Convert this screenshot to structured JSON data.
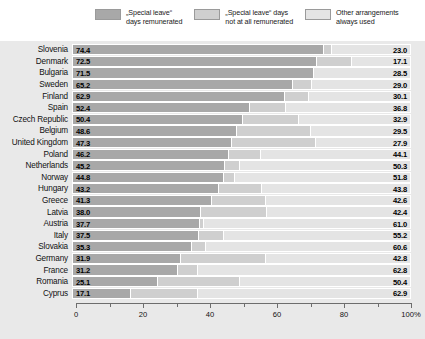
{
  "legend": {
    "items": [
      {
        "label": "„Special leave“\ndays remunerated",
        "color": "#a8a8a8",
        "key": "remunerated"
      },
      {
        "label": "„Special leave“ days\nnot at all remunerated",
        "color": "#cfcfcf",
        "key": "not-remunerated"
      },
      {
        "label": "Other arrangements\nalways used",
        "color": "#e4e4e4",
        "key": "other-arrangements"
      }
    ]
  },
  "axis": {
    "ticks": [
      "0",
      "20",
      "40",
      "60",
      "80",
      "100%"
    ],
    "tick_values": [
      0,
      20,
      40,
      60,
      80,
      100
    ],
    "minor_values": [
      10,
      30,
      50,
      70,
      90
    ]
  },
  "chart_data": {
    "type": "bar",
    "orientation": "horizontal",
    "stacked": true,
    "normalized": "100%",
    "title": "",
    "xlabel": "",
    "ylabel": "",
    "xlim": [
      0,
      100
    ],
    "grid": false,
    "legend_position": "top",
    "categories": [
      "Slovenia",
      "Denmark",
      "Bulgaria",
      "Sweden",
      "Finland",
      "Spain",
      "Czech Republic",
      "Belgium",
      "United Kingdom",
      "Poland",
      "Netherlands",
      "Norway",
      "Hungary",
      "Greece",
      "Latvia",
      "Austria",
      "Italy",
      "Slovakia",
      "Germany",
      "France",
      "Romania",
      "Cyprus"
    ],
    "series": [
      {
        "name": "„Special leave“ days remunerated",
        "color": "#a8a8a8",
        "values": [
          74.4,
          72.5,
          71.5,
          65.2,
          62.9,
          52.4,
          50.4,
          48.6,
          47.3,
          46.2,
          45.2,
          44.8,
          43.2,
          41.3,
          38.0,
          37.7,
          37.5,
          35.3,
          31.9,
          31.2,
          25.1,
          17.1
        ]
      },
      {
        "name": "„Special leave“ days not at all remunerated",
        "color": "#cfcfcf",
        "values": [
          2.6,
          10.4,
          0.0,
          5.8,
          7.0,
          10.8,
          16.7,
          21.9,
          24.8,
          9.7,
          4.5,
          3.4,
          13.0,
          16.1,
          19.6,
          1.3,
          7.3,
          4.1,
          25.3,
          6.0,
          24.5,
          20.0
        ]
      },
      {
        "name": "Other arrangements always used",
        "color": "#e4e4e4",
        "values": [
          23.0,
          17.1,
          28.5,
          29.0,
          30.1,
          36.8,
          32.9,
          29.5,
          27.9,
          44.1,
          50.3,
          51.8,
          43.8,
          42.6,
          42.4,
          61.0,
          55.2,
          60.6,
          42.8,
          62.8,
          50.4,
          62.9
        ]
      }
    ],
    "rows": [
      {
        "country": "Slovenia",
        "left": "74.4",
        "right": "23.0",
        "a": 74.4,
        "b": 2.6,
        "c": 23.0
      },
      {
        "country": "Denmark",
        "left": "72.5",
        "right": "17.1",
        "a": 72.5,
        "b": 10.4,
        "c": 17.1
      },
      {
        "country": "Bulgaria",
        "left": "71.5",
        "right": "28.5",
        "a": 71.5,
        "b": 0.0,
        "c": 28.5
      },
      {
        "country": "Sweden",
        "left": "65.2",
        "right": "29.0",
        "a": 65.2,
        "b": 5.8,
        "c": 29.0
      },
      {
        "country": "Finland",
        "left": "62.9",
        "right": "30.1",
        "a": 62.9,
        "b": 7.0,
        "c": 30.1
      },
      {
        "country": "Spain",
        "left": "52.4",
        "right": "36.8",
        "a": 52.4,
        "b": 10.8,
        "c": 36.8
      },
      {
        "country": "Czech Republic",
        "left": "50.4",
        "right": "32.9",
        "a": 50.4,
        "b": 16.7,
        "c": 32.9
      },
      {
        "country": "Belgium",
        "left": "48.6",
        "right": "29.5",
        "a": 48.6,
        "b": 21.9,
        "c": 29.5
      },
      {
        "country": "United Kingdom",
        "left": "47.3",
        "right": "27.9",
        "a": 47.3,
        "b": 24.8,
        "c": 27.9
      },
      {
        "country": "Poland",
        "left": "46.2",
        "right": "44.1",
        "a": 46.2,
        "b": 9.7,
        "c": 44.1
      },
      {
        "country": "Netherlands",
        "left": "45.2",
        "right": "50.3",
        "a": 45.2,
        "b": 4.5,
        "c": 50.3
      },
      {
        "country": "Norway",
        "left": "44.8",
        "right": "51.8",
        "a": 44.8,
        "b": 3.4,
        "c": 51.8
      },
      {
        "country": "Hungary",
        "left": "43.2",
        "right": "43.8",
        "a": 43.2,
        "b": 13.0,
        "c": 43.8
      },
      {
        "country": "Greece",
        "left": "41.3",
        "right": "42.6",
        "a": 41.3,
        "b": 16.1,
        "c": 42.6
      },
      {
        "country": "Latvia",
        "left": "38.0",
        "right": "42.4",
        "a": 38.0,
        "b": 19.6,
        "c": 42.4
      },
      {
        "country": "Austria",
        "left": "37.7",
        "right": "61.0",
        "a": 37.7,
        "b": 1.3,
        "c": 61.0
      },
      {
        "country": "Italy",
        "left": "37.5",
        "right": "55.2",
        "a": 37.5,
        "b": 7.3,
        "c": 55.2
      },
      {
        "country": "Slovakia",
        "left": "35.3",
        "right": "60.6",
        "a": 35.3,
        "b": 4.1,
        "c": 60.6
      },
      {
        "country": "Germany",
        "left": "31.9",
        "right": "42.8",
        "a": 31.9,
        "b": 25.3,
        "c": 42.8
      },
      {
        "country": "France",
        "left": "31.2",
        "right": "62.8",
        "a": 31.2,
        "b": 6.0,
        "c": 62.8
      },
      {
        "country": "Romania",
        "left": "25.1",
        "right": "50.4",
        "a": 25.1,
        "b": 24.5,
        "c": 50.4
      },
      {
        "country": "Cyprus",
        "left": "17.1",
        "right": "62.9",
        "a": 17.1,
        "b": 20.0,
        "c": 62.9
      }
    ]
  }
}
